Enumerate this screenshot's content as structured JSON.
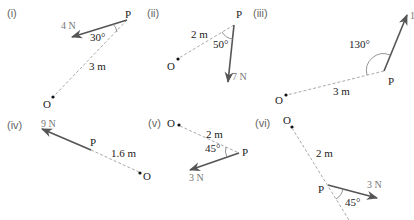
{
  "diagram": {
    "colors": {
      "force": "#555555",
      "dashed": "#aaaaaa",
      "text": "#222222",
      "panel_label": "#666666",
      "force_label": "#777777"
    },
    "panels": [
      {
        "id": "i",
        "label": "(i)",
        "point_O": "O",
        "point_P": "P",
        "force": "4 N",
        "distance": "3 m",
        "angle": "30°"
      },
      {
        "id": "ii",
        "label": "(ii)",
        "point_O": "O",
        "point_P": "P",
        "force": "7 N",
        "distance": "2 m",
        "angle": "50°"
      },
      {
        "id": "iii",
        "label": "(iii)",
        "point_O": "O",
        "point_P": "P",
        "force": "1",
        "distance": "3 m",
        "angle": "130°"
      },
      {
        "id": "iv",
        "label": "(iv)",
        "point_O": "O",
        "point_P": "P",
        "force": "9 N",
        "distance": "1.6 m",
        "angle": ""
      },
      {
        "id": "v",
        "label": "(v)",
        "point_O": "O",
        "point_P": "P",
        "force": "3 N",
        "distance": "2 m",
        "angle": "45°"
      },
      {
        "id": "vi",
        "label": "(vi)",
        "point_O": "O",
        "point_P": "P",
        "force": "3 N",
        "distance": "2 m",
        "angle": "45°"
      }
    ]
  }
}
